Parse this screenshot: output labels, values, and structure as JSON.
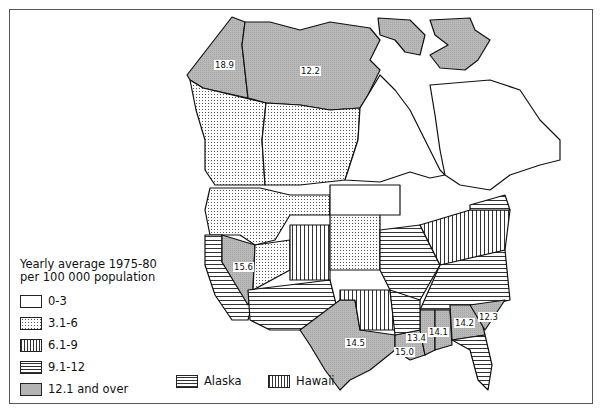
{
  "legend": {
    "title_line1": "Yearly average 1975-80",
    "title_line2": "per 100 000 population",
    "items": [
      {
        "label": "0-3",
        "pattern": "blank"
      },
      {
        "label": "3.1-6",
        "pattern": "dots"
      },
      {
        "label": "6.1-9",
        "pattern": "vertical-lines"
      },
      {
        "label": "9.1-12",
        "pattern": "horizontal-lines"
      },
      {
        "label": "12.1 and over",
        "pattern": "gray-fill"
      }
    ],
    "insets": [
      {
        "label": "Alaska",
        "pattern": "horizontal-lines"
      },
      {
        "label": "Hawaii",
        "pattern": "vertical-lines"
      }
    ]
  },
  "labels": {
    "yukon": "18.9",
    "nwt": "12.2",
    "nevada": "15.6",
    "texas": "14.5",
    "louisiana": "15.0",
    "mississippi": "13.4",
    "alabama": "14.1",
    "georgia": "14.2",
    "south_carolina": "12.3"
  },
  "colors": {
    "gray_fill": "#b4b4b4",
    "line": "#111111",
    "background": "#ffffff"
  }
}
